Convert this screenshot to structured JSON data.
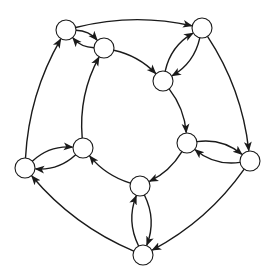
{
  "diagram": {
    "type": "directed-graph",
    "node_radius": 10,
    "colors": {
      "stroke": "#1a1a1a",
      "fill": "#ffffff",
      "background": "#ffffff"
    },
    "nodes": [
      {
        "id": "O1",
        "ring": "outer",
        "x": 66,
        "y": 30
      },
      {
        "id": "O2",
        "ring": "outer",
        "x": 202,
        "y": 28
      },
      {
        "id": "O3",
        "ring": "outer",
        "x": 250,
        "y": 161
      },
      {
        "id": "O4",
        "ring": "outer",
        "x": 143,
        "y": 255
      },
      {
        "id": "O5",
        "ring": "outer",
        "x": 25,
        "y": 168
      },
      {
        "id": "I1",
        "ring": "inner",
        "x": 104,
        "y": 48
      },
      {
        "id": "I2",
        "ring": "inner",
        "x": 163,
        "y": 81
      },
      {
        "id": "I3",
        "ring": "inner",
        "x": 187,
        "y": 143
      },
      {
        "id": "I4",
        "ring": "inner",
        "x": 140,
        "y": 186
      },
      {
        "id": "I5",
        "ring": "inner",
        "x": 83,
        "y": 148
      }
    ],
    "edges": [
      {
        "from": "O1",
        "to": "O2",
        "bend": 0.12
      },
      {
        "from": "O2",
        "to": "O3",
        "bend": 0.12
      },
      {
        "from": "O3",
        "to": "O4",
        "bend": 0.12
      },
      {
        "from": "O4",
        "to": "O5",
        "bend": 0.12
      },
      {
        "from": "O5",
        "to": "O1",
        "bend": 0.12
      },
      {
        "from": "I1",
        "to": "I2",
        "bend": 0.15
      },
      {
        "from": "I2",
        "to": "I3",
        "bend": 0.15
      },
      {
        "from": "I3",
        "to": "I4",
        "bend": 0.15
      },
      {
        "from": "I4",
        "to": "I5",
        "bend": 0.15
      },
      {
        "from": "I5",
        "to": "I1",
        "bend": 0.15
      },
      {
        "from": "O1",
        "to": "I1",
        "bend": 0.22
      },
      {
        "from": "I1",
        "to": "O1",
        "bend": 0.22
      },
      {
        "from": "O2",
        "to": "I2",
        "bend": 0.22
      },
      {
        "from": "I2",
        "to": "O2",
        "bend": 0.22
      },
      {
        "from": "O3",
        "to": "I3",
        "bend": 0.22
      },
      {
        "from": "I3",
        "to": "O3",
        "bend": 0.22
      },
      {
        "from": "O4",
        "to": "I4",
        "bend": 0.22
      },
      {
        "from": "I4",
        "to": "O4",
        "bend": 0.22
      },
      {
        "from": "O5",
        "to": "I5",
        "bend": 0.22
      },
      {
        "from": "I5",
        "to": "O5",
        "bend": 0.22
      }
    ]
  }
}
